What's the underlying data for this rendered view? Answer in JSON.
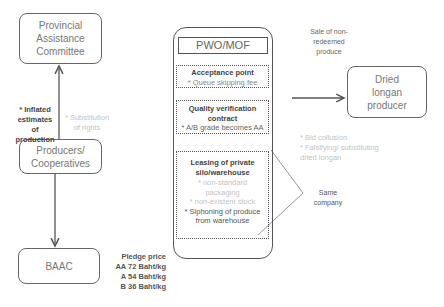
{
  "nodes": {
    "provincial_committee": {
      "label": "Provincial Assistance Committee"
    },
    "producers": {
      "label": "Producers/ Cooperatives"
    },
    "baac": {
      "label": "BAAC"
    },
    "dried_longan": {
      "label": "Dried longan producer"
    },
    "pwo_mof": {
      "title": "PWO/MOF",
      "sections": [
        {
          "title": "Acceptance point",
          "items": [
            {
              "text": "* Queue skipping fee",
              "faint": false
            }
          ]
        },
        {
          "title": "Quality verification contract",
          "items": [
            {
              "text": "* A/B grade becomes AA",
              "faint": false
            }
          ]
        },
        {
          "title": "Leasing of private silo/warehouse",
          "items": [
            {
              "text": "* non-standard packaging",
              "faint": true
            },
            {
              "text": "* non-existent stock",
              "faint": true
            },
            {
              "text": "* Siphoning of produce from warehouse",
              "faint": false
            }
          ]
        }
      ]
    }
  },
  "annotations": {
    "inflated": "* Inflated estimates of production",
    "substitution": "* Substitution of rights",
    "sale": "Sale of non-redeemed produce",
    "bid_collusion": "* Bid collusion",
    "falsifying": "* Falsifying/ substituting dried longan",
    "same_company": "Same company",
    "pledge_title": "Pledge price",
    "pledge_aa": "AA 72 Baht/kg",
    "pledge_a": "A 54 Baht/kg",
    "pledge_b": "B 36 Baht/kg"
  },
  "colors": {
    "line": "#555555",
    "faint_text": "#c4c4c4",
    "text": "#777777"
  }
}
